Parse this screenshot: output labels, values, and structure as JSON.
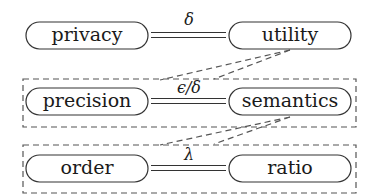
{
  "diagram": {
    "rows": [
      {
        "left": "privacy",
        "right": "utility",
        "relation_symbol": "δ",
        "grouped": false
      },
      {
        "left": "precision",
        "right": "semantics",
        "relation_symbol": "ϵ/δ",
        "grouped": true
      },
      {
        "left": "order",
        "right": "ratio",
        "relation_symbol": "λ",
        "grouped": true
      }
    ],
    "colors": {
      "stroke": "#333333",
      "dashed": "#555555",
      "background": "#ffffff"
    }
  }
}
